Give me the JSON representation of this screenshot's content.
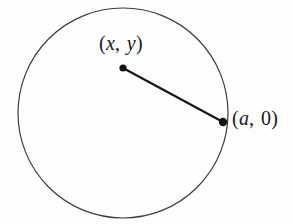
{
  "figure": {
    "type": "geometry-diagram",
    "canvas": {
      "width": 293,
      "height": 224,
      "background_color": "#fefefe"
    },
    "circle": {
      "name": "circle-outline",
      "center_x": 123,
      "center_y": 113,
      "radius": 105,
      "stroke_color": "#3b3b3b",
      "stroke_width": 1.2,
      "fill": "none"
    },
    "segment": {
      "name": "radius-segment",
      "from_x": 123,
      "from_y": 68,
      "to_x": 223,
      "to_y": 122,
      "stroke_color": "#141414",
      "stroke_width": 2.1
    },
    "points": [
      {
        "id": "point-xy",
        "cx": 123,
        "cy": 68,
        "r": 3.6,
        "color": "#121212",
        "label": {
          "open": "(",
          "first": "x",
          "first_style": "italic",
          "separator": ",",
          "second": "y",
          "second_style": "italic",
          "close": ")",
          "plain": "(x, y)"
        }
      },
      {
        "id": "point-a0",
        "cx": 223,
        "cy": 122,
        "r": 4.2,
        "color": "#121212",
        "label": {
          "open": "(",
          "first": "a",
          "first_style": "italic",
          "separator": ",",
          "second": "0",
          "second_style": "upright",
          "close": ")",
          "plain": "(a, 0)"
        }
      }
    ]
  }
}
